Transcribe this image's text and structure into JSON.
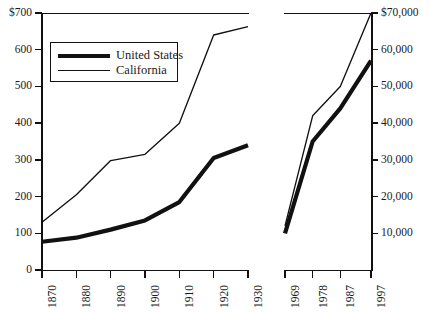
{
  "chart_data": {
    "type": "line",
    "title": "",
    "subtitle": "",
    "xlabel": "",
    "ylabel_left": "",
    "ylabel_right": "",
    "grid": false,
    "legend_position": "top-left-inside",
    "panels": [
      {
        "name": "historical-panel",
        "x": [
          1870,
          1880,
          1890,
          1900,
          1910,
          1920,
          1930
        ],
        "xtick_labels": [
          "1870",
          "1880",
          "1890",
          "1900",
          "1910",
          "1920",
          "1930"
        ],
        "ylim": [
          0,
          700
        ],
        "ytick_labels": [
          "$700",
          "600",
          "500",
          "400",
          "300",
          "200",
          "100",
          "0"
        ],
        "ytick_values": [
          700,
          600,
          500,
          400,
          300,
          200,
          100,
          0
        ],
        "series": [
          {
            "name": "United States",
            "values": [
              77,
              88,
              110,
              135,
              185,
              305,
              340
            ]
          },
          {
            "name": "California",
            "values": [
              130,
              205,
              298,
              315,
              400,
              640,
              663
            ]
          }
        ]
      },
      {
        "name": "modern-panel",
        "x": [
          1969,
          1978,
          1987,
          1997
        ],
        "xtick_labels": [
          "1969",
          "1978",
          "1987",
          "1997"
        ],
        "ylim": [
          0,
          70000
        ],
        "ytick_labels": [
          "$70,000",
          "60,000",
          "50,000",
          "40,000",
          "30,000",
          "20,000",
          "10,000"
        ],
        "ytick_values": [
          70000,
          60000,
          50000,
          40000,
          30000,
          20000,
          10000
        ],
        "series": [
          {
            "name": "United States",
            "values": [
              10000,
              35000,
              44000,
              57000
            ]
          },
          {
            "name": "California",
            "values": [
              12000,
              42000,
              50000,
              70000
            ]
          }
        ]
      }
    ],
    "legend": [
      {
        "label": "United States",
        "style": "thick"
      },
      {
        "label": "California",
        "style": "thin"
      }
    ],
    "colors": {
      "ink": "#111111",
      "background": "#ffffff"
    }
  }
}
